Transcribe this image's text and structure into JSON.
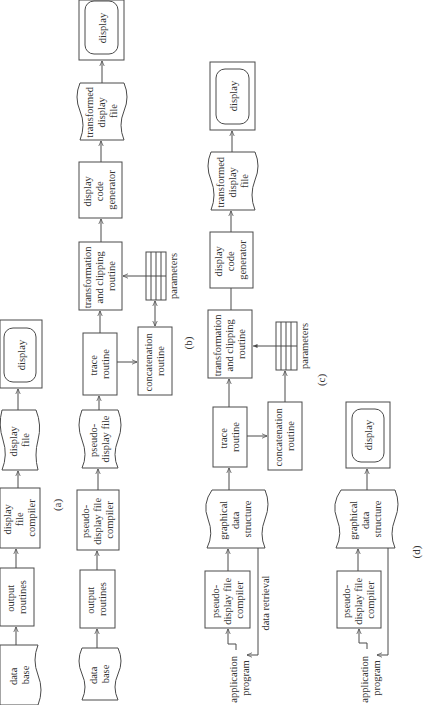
{
  "figure": {
    "panels": [
      {
        "id": "a",
        "caption": "(a)",
        "nodes": [
          {
            "key": "data_base",
            "shape": "document",
            "lines": [
              "data",
              "base"
            ]
          },
          {
            "key": "output_routines",
            "shape": "process",
            "lines": [
              "output",
              "routines"
            ]
          },
          {
            "key": "display_file_compiler",
            "shape": "process",
            "lines": [
              "display",
              "file",
              "compiler"
            ]
          },
          {
            "key": "display_file",
            "shape": "document",
            "lines": [
              "display",
              "file"
            ]
          },
          {
            "key": "display",
            "shape": "monitor",
            "lines": [
              "display"
            ]
          }
        ]
      },
      {
        "id": "b",
        "caption": "(b)",
        "nodes": [
          {
            "key": "data_base",
            "shape": "document",
            "lines": [
              "data",
              "base"
            ]
          },
          {
            "key": "output_routines",
            "shape": "process",
            "lines": [
              "output",
              "routines"
            ]
          },
          {
            "key": "pseudo_display_file_compiler",
            "shape": "process",
            "lines": [
              "pseudo-",
              "display file",
              "compiler"
            ]
          },
          {
            "key": "pseudo_display_file",
            "shape": "document",
            "lines": [
              "pseudo-",
              "display file"
            ]
          },
          {
            "key": "trace_routine",
            "shape": "process",
            "lines": [
              "trace",
              "routine"
            ]
          },
          {
            "key": "concatenation_routine",
            "shape": "process",
            "lines": [
              "concatenation",
              "routine"
            ]
          },
          {
            "key": "parameters",
            "shape": "table",
            "lines": [
              "parameters"
            ]
          },
          {
            "key": "transformation_clipping",
            "shape": "process",
            "lines": [
              "transformation",
              "and clipping",
              "routine"
            ]
          },
          {
            "key": "display_code_generator",
            "shape": "process",
            "lines": [
              "display",
              "code",
              "generator"
            ]
          },
          {
            "key": "transformed_display_file",
            "shape": "document",
            "lines": [
              "transformed",
              "display",
              "file"
            ]
          },
          {
            "key": "display",
            "shape": "monitor",
            "lines": [
              "display"
            ]
          }
        ]
      },
      {
        "id": "c",
        "caption": "(c)",
        "nodes": [
          {
            "key": "application_program",
            "shape": "text",
            "lines": [
              "application",
              "program"
            ]
          },
          {
            "key": "pseudo_display_file_compiler",
            "shape": "process",
            "lines": [
              "pseudo-",
              "display file",
              "compiler"
            ]
          },
          {
            "key": "graphical_data_structure",
            "shape": "document",
            "lines": [
              "graphical",
              "data",
              "structure"
            ]
          },
          {
            "key": "data_retrieval",
            "shape": "edge-label",
            "lines": [
              "data retrieval"
            ]
          },
          {
            "key": "trace_routine",
            "shape": "process",
            "lines": [
              "trace",
              "routine"
            ]
          },
          {
            "key": "concatenation_routine",
            "shape": "process",
            "lines": [
              "concatenation",
              "routine"
            ]
          },
          {
            "key": "parameters",
            "shape": "table",
            "lines": [
              "parameters"
            ]
          },
          {
            "key": "transformation_clipping",
            "shape": "process",
            "lines": [
              "transformation",
              "and clipping",
              "routine"
            ]
          },
          {
            "key": "display_code_generator",
            "shape": "process",
            "lines": [
              "display",
              "code",
              "generator"
            ]
          },
          {
            "key": "transformed_display_file",
            "shape": "document",
            "lines": [
              "transformed",
              "display",
              "file"
            ]
          },
          {
            "key": "display",
            "shape": "monitor",
            "lines": [
              "display"
            ]
          }
        ]
      },
      {
        "id": "d",
        "caption": "(d)",
        "nodes": [
          {
            "key": "application_program",
            "shape": "text",
            "lines": [
              "application",
              "program"
            ]
          },
          {
            "key": "pseudo_display_file_compiler",
            "shape": "process",
            "lines": [
              "pseudo-",
              "display file",
              "compiler"
            ]
          },
          {
            "key": "graphical_data_structure",
            "shape": "document",
            "lines": [
              "graphical",
              "data",
              "structure"
            ]
          },
          {
            "key": "display",
            "shape": "monitor",
            "lines": [
              "display"
            ]
          }
        ]
      }
    ],
    "edges": [
      {
        "panel": "a",
        "from": "data_base",
        "to": "output_routines"
      },
      {
        "panel": "a",
        "from": "output_routines",
        "to": "display_file_compiler"
      },
      {
        "panel": "a",
        "from": "display_file_compiler",
        "to": "display_file"
      },
      {
        "panel": "a",
        "from": "display_file",
        "to": "display"
      },
      {
        "panel": "b",
        "from": "data_base",
        "to": "output_routines"
      },
      {
        "panel": "b",
        "from": "output_routines",
        "to": "pseudo_display_file_compiler"
      },
      {
        "panel": "b",
        "from": "pseudo_display_file_compiler",
        "to": "pseudo_display_file"
      },
      {
        "panel": "b",
        "from": "pseudo_display_file",
        "to": "trace_routine"
      },
      {
        "panel": "b",
        "from": "trace_routine",
        "to": "concatenation_routine"
      },
      {
        "panel": "b",
        "from": "concatenation_routine",
        "to": "parameters",
        "bidirectional": true
      },
      {
        "panel": "b",
        "from": "parameters",
        "to": "transformation_clipping"
      },
      {
        "panel": "b",
        "from": "trace_routine",
        "to": "transformation_clipping"
      },
      {
        "panel": "b",
        "from": "transformation_clipping",
        "to": "display_code_generator"
      },
      {
        "panel": "b",
        "from": "display_code_generator",
        "to": "transformed_display_file"
      },
      {
        "panel": "b",
        "from": "transformed_display_file",
        "to": "display"
      },
      {
        "panel": "c",
        "from": "application_program",
        "to": "pseudo_display_file_compiler"
      },
      {
        "panel": "c",
        "from": "pseudo_display_file_compiler",
        "to": "graphical_data_structure"
      },
      {
        "panel": "c",
        "from": "graphical_data_structure",
        "to": "application_program",
        "label": "data retrieval"
      },
      {
        "panel": "c",
        "from": "graphical_data_structure",
        "to": "trace_routine"
      },
      {
        "panel": "c",
        "from": "trace_routine",
        "to": "concatenation_routine"
      },
      {
        "panel": "c",
        "from": "concatenation_routine",
        "to": "parameters"
      },
      {
        "panel": "c",
        "from": "parameters",
        "to": "transformation_clipping"
      },
      {
        "panel": "c",
        "from": "trace_routine",
        "to": "transformation_clipping"
      },
      {
        "panel": "c",
        "from": "transformation_clipping",
        "to": "display_code_generator",
        "arrow": false
      },
      {
        "panel": "c",
        "from": "display_code_generator",
        "to": "transformed_display_file"
      },
      {
        "panel": "c",
        "from": "transformed_display_file",
        "to": "display"
      },
      {
        "panel": "d",
        "from": "application_program",
        "to": "pseudo_display_file_compiler"
      },
      {
        "panel": "d",
        "from": "pseudo_display_file_compiler",
        "to": "graphical_data_structure"
      },
      {
        "panel": "d",
        "from": "graphical_data_structure",
        "to": "application_program"
      },
      {
        "panel": "d",
        "from": "graphical_data_structure",
        "to": "display"
      }
    ],
    "colors": {
      "ink": "#4a4a4a",
      "text": "#333333",
      "background": "#ffffff"
    }
  }
}
